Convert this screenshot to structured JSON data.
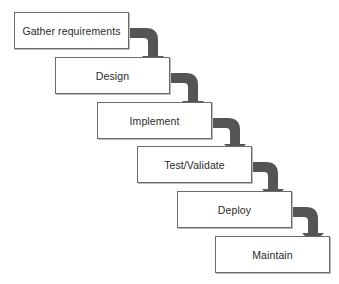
{
  "diagram": {
    "type": "waterfall",
    "stages": [
      {
        "label": "Gather requirements"
      },
      {
        "label": "Design"
      },
      {
        "label": "Implement"
      },
      {
        "label": "Test/Validate"
      },
      {
        "label": "Deploy"
      },
      {
        "label": "Maintain"
      }
    ],
    "colors": {
      "arrow": "#555555",
      "box_border": "#6b6b6b",
      "box_fill": "#ffffff",
      "text": "#2a2a2a"
    }
  }
}
